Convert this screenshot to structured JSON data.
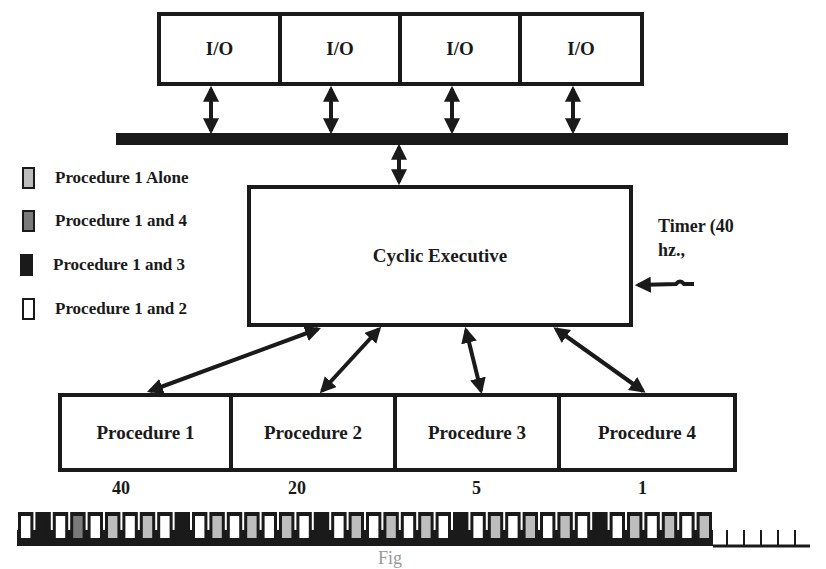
{
  "colors": {
    "ink": "#1a1a1a",
    "proc1_alone": "#bdbdbd",
    "proc1_and_4": "#7a7a7a",
    "proc1_and_3": "#1a1a1a",
    "proc1_and_2": "#ffffff"
  },
  "io_boxes": [
    {
      "label": "I/O"
    },
    {
      "label": "I/O"
    },
    {
      "label": "I/O"
    },
    {
      "label": "I/O"
    }
  ],
  "executive": {
    "label": "Cyclic Executive"
  },
  "timer": {
    "line1": "Timer (40",
    "line2": "hz.,"
  },
  "legend": [
    {
      "label": "Procedure 1 Alone",
      "swatch": "proc1_alone"
    },
    {
      "label": "Procedure 1 and 4",
      "swatch": "proc1_and_4"
    },
    {
      "label": "Procedure 1 and 3",
      "swatch": "proc1_and_3"
    },
    {
      "label": "Procedure 1 and 2",
      "swatch": "proc1_and_2"
    }
  ],
  "procedures": [
    {
      "label": "Procedure 1",
      "rate": "40"
    },
    {
      "label": "Procedure 2",
      "rate": "20"
    },
    {
      "label": "Procedure 3",
      "rate": "5"
    },
    {
      "label": "Procedure 4",
      "rate": "1"
    }
  ],
  "timeline": {
    "slot_count": 40,
    "empty_ticks": 5,
    "pattern": [
      "proc1_and_2",
      "proc1_and_3",
      "proc1_and_2",
      "proc1_and_4",
      "proc1_and_2",
      "proc1_alone",
      "proc1_and_2",
      "proc1_alone",
      "proc1_and_2",
      "proc1_and_3",
      "proc1_and_2",
      "proc1_alone",
      "proc1_and_2",
      "proc1_alone",
      "proc1_and_2",
      "proc1_alone",
      "proc1_and_2",
      "proc1_and_3",
      "proc1_and_2",
      "proc1_alone",
      "proc1_and_2",
      "proc1_alone",
      "proc1_and_2",
      "proc1_alone",
      "proc1_and_2",
      "proc1_and_3",
      "proc1_and_2",
      "proc1_alone",
      "proc1_and_2",
      "proc1_alone",
      "proc1_and_2",
      "proc1_alone",
      "proc1_and_2",
      "proc1_and_3",
      "proc1_and_2",
      "proc1_alone",
      "proc1_and_2",
      "proc1_alone",
      "proc1_and_2",
      "proc1_alone"
    ]
  },
  "caption": "Fig"
}
